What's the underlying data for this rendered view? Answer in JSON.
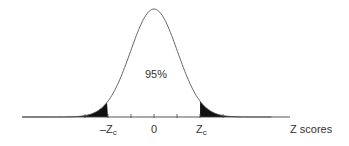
{
  "chart_data": {
    "type": "area",
    "title": "",
    "subtitle": "",
    "xlabel": "Z scores",
    "ylabel": "",
    "center_label": "95%",
    "tick_labels": [
      "-Zc",
      "0",
      "Zc"
    ],
    "critical_values": {
      "lower": -1.96,
      "upper": 1.96
    },
    "central_area_percent": 95,
    "tail_area_percent_each": 2.5,
    "shaded_regions": [
      "left tail (z < -Zc)",
      "right tail (z > Zc)"
    ],
    "xlim": [
      -3.5,
      3.5
    ],
    "grid": false,
    "legend": "none",
    "colors": {
      "curve": "#555555",
      "tails": "#111111",
      "axis": "#444444"
    }
  },
  "labels": {
    "center": "95%",
    "neg_zc_prefix": "–Z",
    "zc_prefix": "Z",
    "zc_sub": "c",
    "zero": "0",
    "axis_title": "Z scores"
  }
}
